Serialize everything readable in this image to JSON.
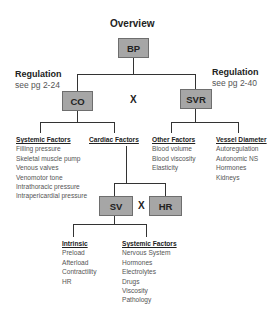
{
  "title": "Overview",
  "nodes": {
    "bp": "BP",
    "co": "CO",
    "svr": "SVR",
    "sv": "SV",
    "hr": "HR"
  },
  "operators": {
    "co_svr": "X",
    "sv_hr": "X"
  },
  "regulation_left": {
    "heading": "Regulation",
    "ref": "see pg 2-24"
  },
  "regulation_right": {
    "heading": "Regulation",
    "ref": "see pg 2-40"
  },
  "groups": {
    "systemic_co": {
      "heading": "Systemic Factors",
      "items": [
        "Filling pressure",
        "Skeletal muscle pump",
        "Venous valves",
        "Venomotor tone",
        "Intrathoracic pressure",
        "Intrapericardial pressure"
      ]
    },
    "cardiac": {
      "heading": "Cardiac Factors"
    },
    "other": {
      "heading": "Other Factors",
      "items": [
        "Blood volume",
        "Blood viscosity",
        "Elasticity"
      ]
    },
    "vessel": {
      "heading": "Vessel Diameter",
      "items": [
        "Autoregulation",
        "Autonomic NS",
        "Hormones",
        "Kidneys"
      ]
    },
    "intrinsic": {
      "heading": "Intrinsic",
      "items": [
        "Preload",
        "Afterload",
        "Contractility",
        "HR"
      ]
    },
    "systemic_sv": {
      "heading": "Systemic Factors",
      "items": [
        "Nervous System",
        "Hormones",
        "Electrolytes",
        "Drugs",
        "Viscosity",
        "Pathology"
      ]
    }
  },
  "colors": {
    "box_fill": "#a6a6a6",
    "box_border": "#6e6e6e",
    "line": "#333333"
  }
}
